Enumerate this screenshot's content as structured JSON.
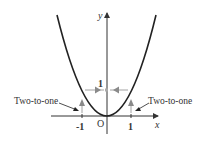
{
  "diagram": {
    "axes": {
      "x_label": "x",
      "y_label": "y",
      "origin_label": "O",
      "x_ticks": [
        "-1",
        "1"
      ],
      "y_ticks": [
        "1"
      ]
    },
    "annotations": {
      "left": "Two-to-one",
      "right": "Two-to-one"
    },
    "colors": {
      "curve": "#222222",
      "axes": "#333333",
      "arrow": "#8a8a8a",
      "text": "#333333"
    }
  }
}
